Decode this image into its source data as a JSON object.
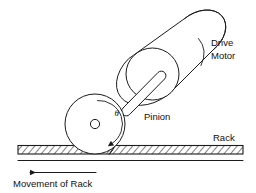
{
  "figure": {
    "background_color": "#ffffff",
    "line_color": "#1b1b1b",
    "width": 256,
    "height": 193
  },
  "labels": {
    "drive_motor_line1": "Drive",
    "drive_motor_line2": "Motor",
    "pinion": "Pinion",
    "rack": "Rack",
    "movement_of_rack": "Movement of Rack",
    "theta": "θ"
  },
  "components": {
    "drive_motor": {
      "name": "Drive Motor",
      "shape": "cylinder",
      "orientation": "tilted",
      "hatched": false
    },
    "shaft": {
      "name": "Shaft",
      "shape": "rounded-rod",
      "connects": "drive motor to pinion"
    },
    "pinion": {
      "name": "Pinion",
      "shape": "circle",
      "teeth_band": "hatched crescent",
      "hub": "small circle",
      "rotation_symbol": "θ",
      "rotation_direction": "clockwise"
    },
    "rack": {
      "name": "Rack",
      "shape": "horizontal hatched bar",
      "motion_direction": "left"
    }
  },
  "annotations": {
    "rotation_arrow_direction": "clockwise",
    "movement_arrow_direction": "left"
  }
}
